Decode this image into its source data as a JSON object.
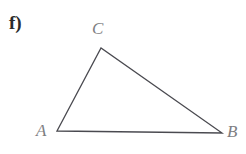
{
  "figure": {
    "item_label": "f)",
    "background_color": "#ffffff",
    "stroke_color": "#4a4a50",
    "stroke_width": 1.3,
    "label_color": "#7e7e82",
    "item_label_color": "#2b2b2b",
    "shape": "triangle",
    "vertices": [
      {
        "name": "A",
        "label": "A",
        "x": 57,
        "y": 131,
        "label_x": 36,
        "label_y": 122
      },
      {
        "name": "B",
        "label": "B",
        "x": 222,
        "y": 133,
        "label_x": 227,
        "label_y": 123
      },
      {
        "name": "C",
        "label": "C",
        "x": 101,
        "y": 48,
        "label_x": 92,
        "label_y": 20
      }
    ],
    "edges": [
      {
        "name": "edge-AC",
        "from": "A",
        "to": "C"
      },
      {
        "name": "edge-CB",
        "from": "C",
        "to": "B"
      },
      {
        "name": "edge-AB",
        "from": "A",
        "to": "B"
      }
    ],
    "polygon_points": "57,131 101,48 222,133"
  }
}
